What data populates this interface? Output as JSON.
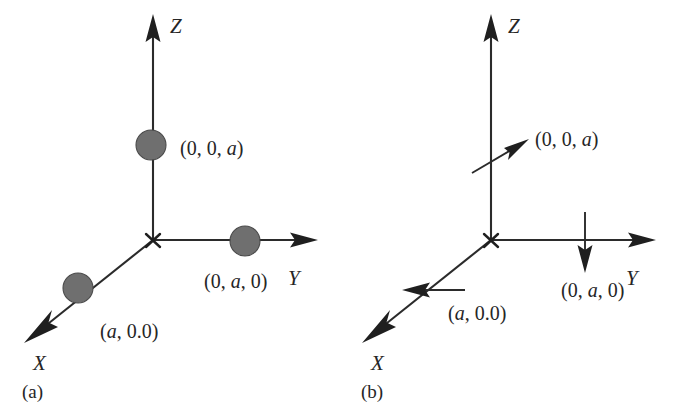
{
  "figure": {
    "background_color": "#ffffff",
    "ink_color": "#262626",
    "atom_fill_color": "#6f6f6f",
    "atom_stroke_color": "#4a4a4a"
  },
  "panels": [
    {
      "id": "a",
      "caption": "(a)",
      "kind": "atom-positions",
      "origin_marker": "x",
      "axes": [
        {
          "name": "Z",
          "label": "Z",
          "direction": "up",
          "arrowhead": "solid-triangle"
        },
        {
          "name": "Y",
          "label": "Y",
          "direction": "right",
          "arrowhead": "solid-triangle"
        },
        {
          "name": "X",
          "label": "X",
          "direction": "down-left",
          "arrowhead": "barbed"
        }
      ],
      "markers": [
        {
          "axis": "Z",
          "shape": "filled-circle",
          "label": "(0, 0, a)",
          "label_parts": [
            "(0, 0, ",
            "a",
            ")"
          ]
        },
        {
          "axis": "Y",
          "shape": "filled-circle",
          "label": "(0, a, 0)",
          "label_parts": [
            "(0, ",
            "a",
            ", 0)"
          ]
        },
        {
          "axis": "X",
          "shape": "filled-circle",
          "label": "(a, 0.0)",
          "label_parts": [
            "(",
            "a",
            ", 0.0)"
          ]
        }
      ]
    },
    {
      "id": "b",
      "caption": "(b)",
      "kind": "displacement-vectors",
      "origin_marker": "x",
      "axes": [
        {
          "name": "Z",
          "label": "Z",
          "direction": "up",
          "arrowhead": "solid-triangle"
        },
        {
          "name": "Y",
          "label": "Y",
          "direction": "right",
          "arrowhead": "solid-triangle"
        },
        {
          "name": "X",
          "label": "X",
          "direction": "down-left",
          "arrowhead": "barbed"
        }
      ],
      "markers": [
        {
          "axis": "Z",
          "shape": "arrow",
          "arrow_direction": "up-right",
          "label": "(0, 0, a)",
          "label_parts": [
            "(0, 0, ",
            "a",
            ")"
          ]
        },
        {
          "axis": "Y",
          "shape": "arrow",
          "arrow_direction": "down",
          "label": "(0, a, 0)",
          "label_parts": [
            "(0, ",
            "a",
            ", 0)"
          ]
        },
        {
          "axis": "X",
          "shape": "arrow",
          "arrow_direction": "left",
          "label": "(a, 0.0)",
          "label_parts": [
            "(",
            "a",
            ", 0.0)"
          ]
        }
      ]
    }
  ]
}
